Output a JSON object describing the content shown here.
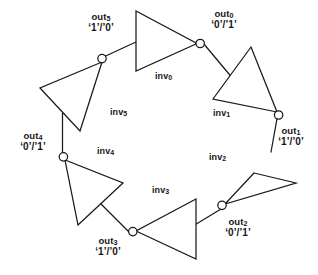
{
  "diagram": {
    "stroke_color": "#1a1a1a",
    "background_color": "#ffffff",
    "stages": [
      {
        "id": "inv0",
        "inverter_label": "inv",
        "inverter_index": "0",
        "output_name": "out",
        "output_index": "0",
        "output_value": "‘0’/’1’"
      },
      {
        "id": "inv1",
        "inverter_label": "inv",
        "inverter_index": "1",
        "output_name": "out",
        "output_index": "1",
        "output_value": "‘1’/’0’"
      },
      {
        "id": "inv2",
        "inverter_label": "inv",
        "inverter_index": "2",
        "output_name": "out",
        "output_index": "2",
        "output_value": "‘0’/’1’"
      },
      {
        "id": "inv3",
        "inverter_label": "inv",
        "inverter_index": "3",
        "output_name": "out",
        "output_index": "3",
        "output_value": "‘1’/’0’"
      },
      {
        "id": "inv4",
        "inverter_label": "inv",
        "inverter_index": "4",
        "output_name": "out",
        "output_index": "4",
        "output_value": "‘0’/’1’"
      },
      {
        "id": "inv5",
        "inverter_label": "inv",
        "inverter_index": "5",
        "output_name": "out",
        "output_index": "5",
        "output_value": "‘1’/’0’"
      }
    ]
  }
}
